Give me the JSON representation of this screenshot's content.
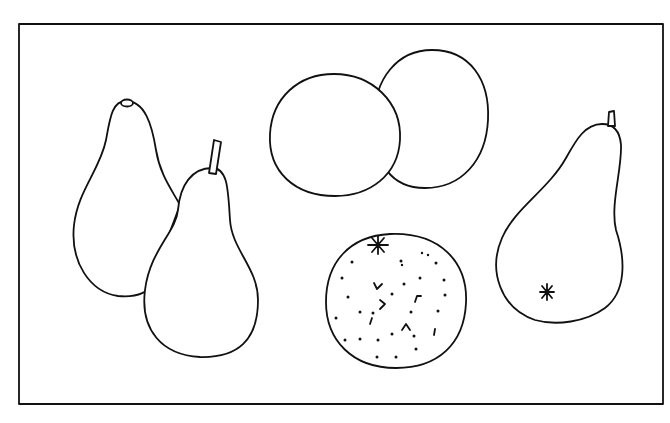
{
  "image": {
    "kind": "line drawing",
    "subject": "Still life of fruit: pears and oranges",
    "frame": {
      "stroke": "#111111",
      "background": "#ffffff"
    },
    "objects": [
      {
        "name": "pear-back-left",
        "type": "pear",
        "stem": "nub"
      },
      {
        "name": "pear-front-left",
        "type": "pear",
        "stem": "stalk"
      },
      {
        "name": "orange-plain-left",
        "type": "orange",
        "texture": "smooth"
      },
      {
        "name": "orange-plain-right",
        "type": "orange",
        "texture": "smooth"
      },
      {
        "name": "orange-dotted",
        "type": "orange",
        "texture": "dimpled",
        "detail": "star calyx"
      },
      {
        "name": "pear-right",
        "type": "pear",
        "stem": "stalk",
        "detail": "star blossom end"
      }
    ]
  },
  "caption": "Line drawing of three pears and three oranges"
}
